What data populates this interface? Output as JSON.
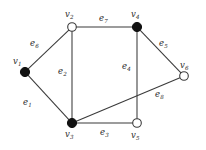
{
  "figure": {
    "type": "undirected-graph-diagram",
    "background_color": "#ffffff",
    "edge_color": "#3a3a3a",
    "vertex_fill_color": "#111111",
    "vertex_open_color": "#ffffff",
    "label_color": "#2b2b2b"
  },
  "graph_data": {
    "type": "graph",
    "vertex_count": 6,
    "edge_count": 8,
    "vertices": [
      {
        "id": "v1",
        "label": "v",
        "sub": "1",
        "x": 25,
        "y": 72,
        "style": "filled",
        "radius": 4.6,
        "label_x": 13,
        "label_y": 57
      },
      {
        "id": "v2",
        "label": "v",
        "sub": "2",
        "x": 72,
        "y": 27,
        "style": "open",
        "radius": 4.3,
        "label_x": 65,
        "label_y": 10
      },
      {
        "id": "v3",
        "label": "v",
        "sub": "3",
        "x": 72,
        "y": 123,
        "style": "filled",
        "radius": 4.6,
        "label_x": 65,
        "label_y": 130
      },
      {
        "id": "v4",
        "label": "v",
        "sub": "4",
        "x": 137,
        "y": 27,
        "style": "filled",
        "radius": 4.6,
        "label_x": 131,
        "label_y": 10
      },
      {
        "id": "v5",
        "label": "v",
        "sub": "5",
        "x": 137,
        "y": 123,
        "style": "open",
        "radius": 4.3,
        "label_x": 131,
        "label_y": 131
      },
      {
        "id": "v6",
        "label": "v",
        "sub": "6",
        "x": 184,
        "y": 76,
        "style": "open",
        "radius": 4.3,
        "label_x": 180,
        "label_y": 61
      }
    ],
    "edges": [
      {
        "id": "e1",
        "label": "e",
        "sub": "1",
        "from": "v1",
        "to": "v3",
        "label_x": 23,
        "label_y": 98
      },
      {
        "id": "e2",
        "label": "e",
        "sub": "2",
        "from": "v2",
        "to": "v3",
        "label_x": 58,
        "label_y": 67
      },
      {
        "id": "e3",
        "label": "e",
        "sub": "3",
        "from": "v3",
        "to": "v5",
        "label_x": 100,
        "label_y": 128
      },
      {
        "id": "e4",
        "label": "e",
        "sub": "4",
        "from": "v4",
        "to": "v5",
        "label_x": 122,
        "label_y": 62
      },
      {
        "id": "e5",
        "label": "e",
        "sub": "5",
        "from": "v4",
        "to": "v6",
        "label_x": 159,
        "label_y": 39
      },
      {
        "id": "e6",
        "label": "e",
        "sub": "6",
        "from": "v1",
        "to": "v2",
        "label_x": 30,
        "label_y": 39
      },
      {
        "id": "e7",
        "label": "e",
        "sub": "7",
        "from": "v2",
        "to": "v4",
        "label_x": 99,
        "label_y": 14
      },
      {
        "id": "e8",
        "label": "e",
        "sub": "8",
        "from": "v3",
        "to": "v6",
        "label_x": 155,
        "label_y": 90
      }
    ]
  }
}
